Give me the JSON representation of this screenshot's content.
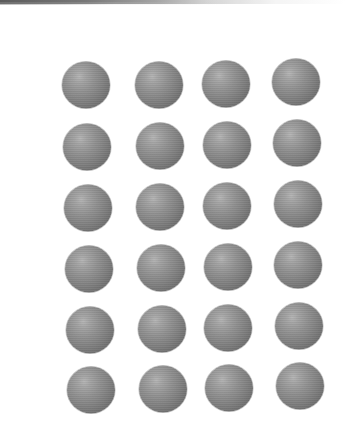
{
  "image": {
    "description": "Grid of identical shaded gray spheres on white background",
    "rows": 6,
    "columns": 4,
    "background_color": "#ffffff",
    "sphere_color": "#8a8a8a",
    "sphere_highlight_color": "#b4b4b4",
    "sphere_edge_color": "#5e5e5e",
    "sphere_diameter_px": 48
  },
  "spheres": [
    {
      "row": 1,
      "col": 1,
      "cx": 86,
      "cy": 85
    },
    {
      "row": 1,
      "col": 2,
      "cx": 159,
      "cy": 85
    },
    {
      "row": 1,
      "col": 3,
      "cx": 226,
      "cy": 84
    },
    {
      "row": 1,
      "col": 4,
      "cx": 296,
      "cy": 82
    },
    {
      "row": 2,
      "col": 1,
      "cx": 87,
      "cy": 147
    },
    {
      "row": 2,
      "col": 2,
      "cx": 160,
      "cy": 146
    },
    {
      "row": 2,
      "col": 3,
      "cx": 227,
      "cy": 145
    },
    {
      "row": 2,
      "col": 4,
      "cx": 297,
      "cy": 143
    },
    {
      "row": 3,
      "col": 1,
      "cx": 88,
      "cy": 208
    },
    {
      "row": 3,
      "col": 2,
      "cx": 160,
      "cy": 207
    },
    {
      "row": 3,
      "col": 3,
      "cx": 227,
      "cy": 206
    },
    {
      "row": 3,
      "col": 4,
      "cx": 298,
      "cy": 204
    },
    {
      "row": 4,
      "col": 1,
      "cx": 89,
      "cy": 269
    },
    {
      "row": 4,
      "col": 2,
      "cx": 161,
      "cy": 268
    },
    {
      "row": 4,
      "col": 3,
      "cx": 228,
      "cy": 267
    },
    {
      "row": 4,
      "col": 4,
      "cx": 298,
      "cy": 265
    },
    {
      "row": 5,
      "col": 1,
      "cx": 90,
      "cy": 330
    },
    {
      "row": 5,
      "col": 2,
      "cx": 162,
      "cy": 329
    },
    {
      "row": 5,
      "col": 3,
      "cx": 228,
      "cy": 328
    },
    {
      "row": 5,
      "col": 4,
      "cx": 299,
      "cy": 326
    },
    {
      "row": 6,
      "col": 1,
      "cx": 91,
      "cy": 390
    },
    {
      "row": 6,
      "col": 2,
      "cx": 163,
      "cy": 389
    },
    {
      "row": 6,
      "col": 3,
      "cx": 229,
      "cy": 388
    },
    {
      "row": 6,
      "col": 4,
      "cx": 300,
      "cy": 386
    }
  ]
}
